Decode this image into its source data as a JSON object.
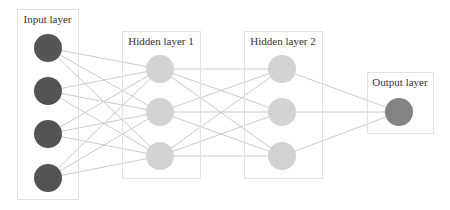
{
  "diagram": {
    "colors": {
      "input_node": "#545454",
      "hidden_node": "#d3d3d3",
      "output_node": "#838383",
      "edge": "#c4c4c4",
      "box_border": "#e2e2e2"
    },
    "layers": [
      {
        "id": "input",
        "label": "Input layer",
        "box": {
          "x": 17,
          "y": 9,
          "w": 61,
          "h": 190
        },
        "label_pos": {
          "x": 47.5,
          "y": 23
        },
        "node_type": "input",
        "nodes": [
          {
            "cx": 48,
            "cy": 48
          },
          {
            "cx": 48,
            "cy": 91
          },
          {
            "cx": 48,
            "cy": 134
          },
          {
            "cx": 48,
            "cy": 178
          }
        ]
      },
      {
        "id": "hidden1",
        "label": "Hidden layer 1",
        "box": {
          "x": 122,
          "y": 31,
          "w": 78,
          "h": 147
        },
        "label_pos": {
          "x": 161,
          "y": 45
        },
        "node_type": "hidden",
        "nodes": [
          {
            "cx": 160,
            "cy": 69
          },
          {
            "cx": 160,
            "cy": 112
          },
          {
            "cx": 160,
            "cy": 156
          }
        ]
      },
      {
        "id": "hidden2",
        "label": "Hidden layer 2",
        "box": {
          "x": 244,
          "y": 31,
          "w": 78,
          "h": 147
        },
        "label_pos": {
          "x": 283,
          "y": 45
        },
        "node_type": "hidden",
        "nodes": [
          {
            "cx": 282,
            "cy": 69
          },
          {
            "cx": 282,
            "cy": 112
          },
          {
            "cx": 282,
            "cy": 156
          }
        ]
      },
      {
        "id": "output",
        "label": "Output layer",
        "box": {
          "x": 367,
          "y": 72,
          "w": 66,
          "h": 61
        },
        "label_pos": {
          "x": 400,
          "y": 86
        },
        "node_type": "output",
        "nodes": [
          {
            "cx": 399,
            "cy": 112
          }
        ]
      }
    ],
    "node_radius": 14,
    "connectivity": "fully-connected between adjacent layers"
  }
}
